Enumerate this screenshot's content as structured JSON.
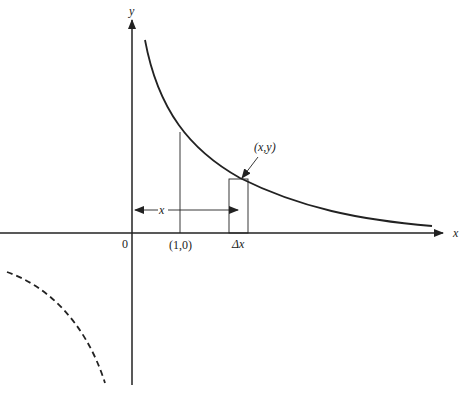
{
  "diagram": {
    "labels": {
      "y_axis": "y",
      "x_axis": "x",
      "origin": "0",
      "point_one": "(1,0)",
      "delta_x": "Δx",
      "point_xy": "(x,y)",
      "x_span": "x"
    },
    "colors": {
      "ink": "#222222",
      "background": "#ffffff"
    },
    "elements": [
      "x-axis",
      "y-axis",
      "hyperbola-first-quadrant",
      "hyperbola-third-quadrant-dashed",
      "vertical-line-at-1",
      "strip-rectangle",
      "x-span-arrow",
      "pointer-arrow-to-xy"
    ]
  }
}
